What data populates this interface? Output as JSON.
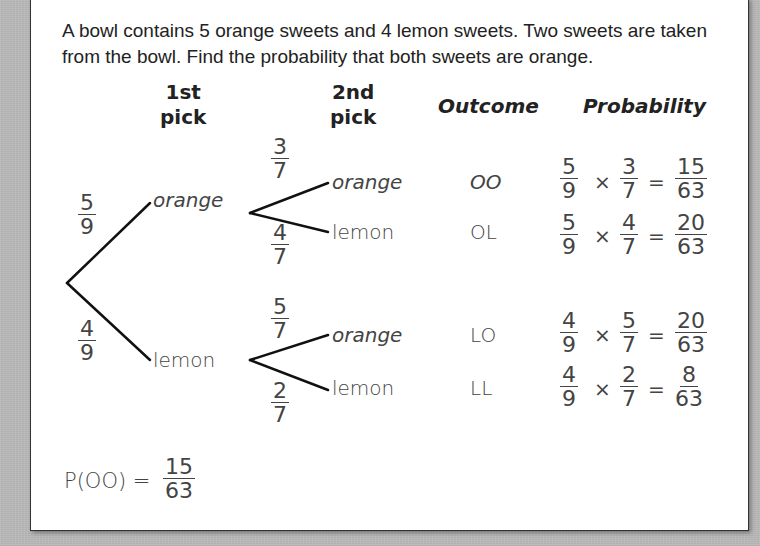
{
  "question": "A bowl contains 5 orange sweets and 4 lemon sweets. Two sweets are taken from the bowl. Find the probability that both sweets are orange.",
  "headers": {
    "first_pick": [
      "1st",
      "pick"
    ],
    "second_pick": [
      "2nd",
      "pick"
    ],
    "outcome": "Outcome",
    "probability": "Probability"
  },
  "tree": {
    "first": [
      {
        "label": "orange",
        "prob": {
          "num": "5",
          "den": "9"
        }
      },
      {
        "label": "lemon",
        "prob": {
          "num": "4",
          "den": "9"
        }
      }
    ],
    "second": [
      {
        "label": "orange",
        "prob": {
          "num": "3",
          "den": "7"
        },
        "outcome": "OO",
        "calc": {
          "a": [
            "5",
            "9"
          ],
          "b": [
            "3",
            "7"
          ],
          "r": [
            "15",
            "63"
          ]
        }
      },
      {
        "label": "lemon",
        "prob": {
          "num": "4",
          "den": "7"
        },
        "outcome": "OL",
        "calc": {
          "a": [
            "5",
            "9"
          ],
          "b": [
            "4",
            "7"
          ],
          "r": [
            "20",
            "63"
          ]
        }
      },
      {
        "label": "orange",
        "prob": {
          "num": "5",
          "den": "7"
        },
        "outcome": "LO",
        "calc": {
          "a": [
            "4",
            "9"
          ],
          "b": [
            "5",
            "7"
          ],
          "r": [
            "20",
            "63"
          ]
        }
      },
      {
        "label": "lemon",
        "prob": {
          "num": "2",
          "den": "7"
        },
        "outcome": "LL",
        "calc": {
          "a": [
            "4",
            "9"
          ],
          "b": [
            "2",
            "7"
          ],
          "r": [
            "8",
            "63"
          ]
        }
      }
    ]
  },
  "symbols": {
    "times": "×",
    "equals": "="
  },
  "answer": {
    "label": "P(OO) =",
    "num": "15",
    "den": "63"
  }
}
